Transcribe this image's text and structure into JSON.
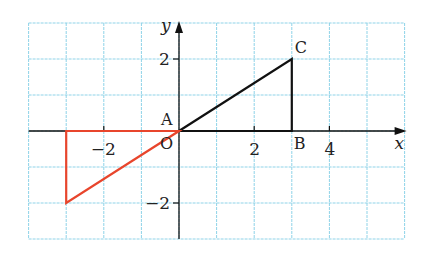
{
  "figure": {
    "grid": {
      "x_min": -4,
      "x_max": 6,
      "y_min": -3,
      "y_max": 3,
      "unit_px_x": 37.6,
      "unit_px_y": 36,
      "origin_px": [
        179,
        131
      ],
      "color": "#8fd3e8"
    },
    "axes": {
      "x_label": "x",
      "y_label": "y",
      "color": "#111111",
      "x_ticks": [
        {
          "value": -2,
          "label": "−2"
        },
        {
          "value": 2,
          "label": "2"
        },
        {
          "value": 4,
          "label": "4"
        }
      ],
      "y_ticks": [
        {
          "value": 2,
          "label": "2"
        },
        {
          "value": -2,
          "label": "−2"
        }
      ],
      "origin_label": "O"
    },
    "points": {
      "A": {
        "label": "A",
        "x": 0,
        "y": 0
      },
      "B": {
        "label": "B",
        "x": 3,
        "y": 0
      },
      "C": {
        "label": "C",
        "x": 3,
        "y": 2
      }
    },
    "triangles": [
      {
        "name": "ABC",
        "vertices": [
          [
            0,
            0
          ],
          [
            3,
            0
          ],
          [
            3,
            2
          ]
        ],
        "color": "#111111"
      },
      {
        "name": "image",
        "vertices": [
          [
            0,
            0
          ],
          [
            -3,
            0
          ],
          [
            -3,
            -2
          ]
        ],
        "color": "#e8452c"
      }
    ]
  }
}
